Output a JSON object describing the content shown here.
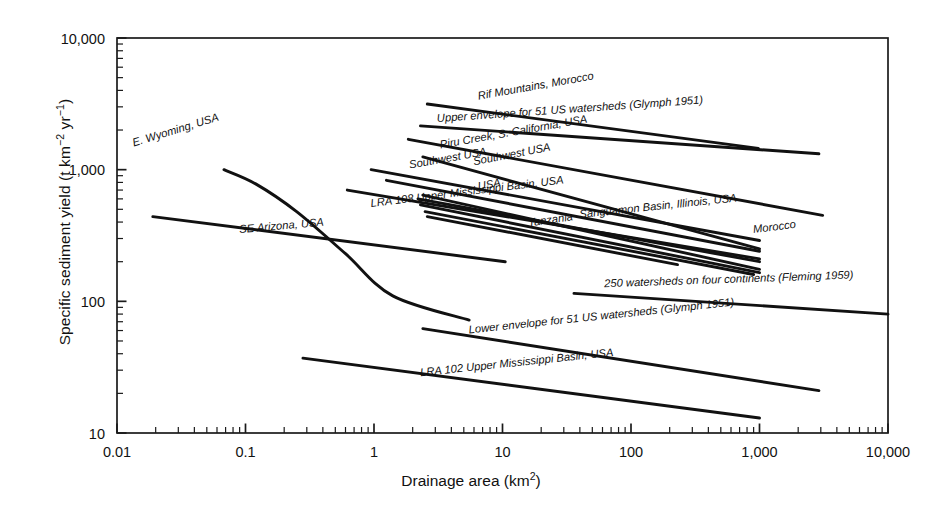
{
  "chart_data": {
    "type": "line",
    "title": "",
    "xlabel": "Drainage area (km²)",
    "ylabel": "Specific sediment yield (t km⁻² yr⁻¹)",
    "xscale": "log",
    "yscale": "log",
    "xlim": [
      0.01,
      10000
    ],
    "ylim": [
      10,
      10000
    ],
    "grid": false,
    "legend": "inline-labels",
    "xticks": [
      "0.01",
      "0.1",
      "1",
      "10",
      "100",
      "1,000",
      "10,000"
    ],
    "xtick_values": [
      0.01,
      0.1,
      1,
      10,
      100,
      1000,
      10000
    ],
    "yticks": [
      "10",
      "100",
      "1,000",
      "10,000"
    ],
    "ytick_values": [
      10,
      100,
      1000,
      10000
    ],
    "series": [
      {
        "name": "E. Wyoming, USA",
        "label": "E. Wyoming, USA",
        "shape": "curve",
        "points": [
          [
            0.068,
            1000
          ],
          [
            0.12,
            780
          ],
          [
            0.25,
            480
          ],
          [
            0.6,
            230
          ],
          [
            1.4,
            110
          ],
          [
            5.5,
            72
          ]
        ],
        "label_anchor": [
          0.0135,
          1500
        ],
        "label_rotation": -17
      },
      {
        "name": "SE Arizona, USA",
        "label": "SE Arizona, USA",
        "shape": "line",
        "points": [
          [
            0.019,
            440
          ],
          [
            10.5,
            200
          ]
        ],
        "label_anchor": [
          0.09,
          330
        ],
        "label_rotation": -5
      },
      {
        "name": "Rif Mountains, Morocco",
        "label": "Rif Mountains, Morocco",
        "shape": "line",
        "points": [
          [
            2.6,
            3150
          ],
          [
            980,
            1450
          ]
        ],
        "label_anchor": [
          6.5,
          3400
        ],
        "label_rotation": -10
      },
      {
        "name": "Upper envelope for 51 US watersheds (Glymph 1951)",
        "label": "Upper envelope for 51 US watersheds (Glymph 1951)",
        "shape": "line",
        "points": [
          [
            2.3,
            2150
          ],
          [
            2900,
            1320
          ]
        ],
        "label_anchor": [
          3.1,
          2300
        ],
        "label_rotation": -4
      },
      {
        "name": "Piru Creek, S. California, USA",
        "label": "Piru Creek, S. California, USA",
        "shape": "line",
        "points": [
          [
            1.85,
            1700
          ],
          [
            3100,
            450
          ]
        ],
        "label_anchor": [
          3.3,
          1450
        ],
        "label_rotation": -10
      },
      {
        "name": "Southwest USA (upper)",
        "label": "Southwest USA",
        "shape": "line",
        "points": [
          [
            0.95,
            1000
          ],
          [
            1000,
            290
          ]
        ],
        "label_anchor": [
          1.9,
          1020
        ],
        "label_rotation": -10
      },
      {
        "name": "Southwest USA (lower)",
        "label": "Southwest USA",
        "shape": "line",
        "points": [
          [
            2.4,
            1250
          ],
          [
            1000,
            250
          ]
        ],
        "label_anchor": [
          6.0,
          1080
        ],
        "label_rotation": -11
      },
      {
        "name": "USA",
        "label": "USA",
        "shape": "line",
        "points": [
          [
            1.25,
            830
          ],
          [
            1000,
            240
          ]
        ],
        "label_anchor": [
          6.5,
          700
        ],
        "label_rotation": -10
      },
      {
        "name": "LRA 108 Upper Mississippi Basin, USA",
        "label": "LRA 108 Upper Mississippi Basin, USA",
        "shape": "line",
        "points": [
          [
            0.62,
            700
          ],
          [
            1000,
            210
          ]
        ],
        "label_anchor": [
          0.95,
          520
        ],
        "label_rotation": -7
      },
      {
        "name": "Tanzania",
        "label": "Tanzania",
        "shape": "line",
        "points": [
          [
            2.2,
            600
          ],
          [
            1000,
            200
          ]
        ],
        "label_anchor": [
          16,
          370
        ],
        "label_rotation": -8
      },
      {
        "name": "Sanguamon Basin, Illinois, USA",
        "label": "Sanguamon Basin, Illinois, USA",
        "shape": "line",
        "points": [
          [
            2.4,
            640
          ],
          [
            1000,
            175
          ]
        ],
        "label_anchor": [
          40,
          430
        ],
        "label_rotation": -6
      },
      {
        "name": "Morocco",
        "label": "Morocco",
        "shape": "line",
        "points": [
          [
            2.3,
            540
          ],
          [
            1000,
            165
          ]
        ],
        "label_anchor": [
          900,
          330
        ],
        "label_rotation": -7
      },
      {
        "name": "Unlabelled trend A",
        "label": "",
        "shape": "line",
        "points": [
          [
            2.5,
            480
          ],
          [
            900,
            160
          ]
        ],
        "label_anchor": null,
        "label_rotation": 0
      },
      {
        "name": "Unlabelled trend B",
        "label": "",
        "shape": "line",
        "points": [
          [
            2.6,
            440
          ],
          [
            230,
            190
          ]
        ],
        "label_anchor": null,
        "label_rotation": 0
      },
      {
        "name": "250 watersheds on four continents (Fleming 1959)",
        "label": "250 watersheds on four continents (Fleming 1959)",
        "shape": "line",
        "points": [
          [
            36,
            115
          ],
          [
            10000,
            80
          ]
        ],
        "label_anchor": [
          62,
          128
        ],
        "label_rotation": -2
      },
      {
        "name": "Lower envelope for 51 US watersheds (Glymph 1951)",
        "label": "Lower envelope for 51 US watersheds (Glymph 1951)",
        "shape": "line",
        "points": [
          [
            2.4,
            62
          ],
          [
            2900,
            21
          ]
        ],
        "label_anchor": [
          5.5,
          57
        ],
        "label_rotation": -6
      },
      {
        "name": "LRA 102 Upper Mississippi Basin, USA",
        "label": "LRA 102 Upper Mississippi Basin, USA",
        "shape": "line",
        "points": [
          [
            0.28,
            37
          ],
          [
            1000,
            13
          ]
        ],
        "label_anchor": [
          2.3,
          27
        ],
        "label_rotation": -6
      }
    ]
  },
  "axes": {
    "x_title": "Drainage area (km",
    "x_title_sup": "2",
    "x_title_tail": ")",
    "y_title_a": "Specific sediment yield (t km",
    "y_title_sup1": "−2",
    "y_title_mid": " yr",
    "y_title_sup2": "−1",
    "y_title_tail": ")"
  }
}
